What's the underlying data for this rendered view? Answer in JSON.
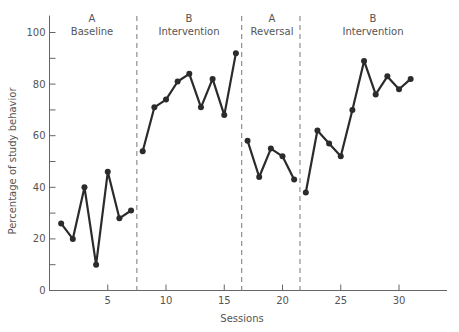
{
  "chart_data": {
    "type": "line",
    "title": "",
    "xlabel": "Sessions",
    "ylabel": "Percentage of study behavior",
    "xlim": [
      0,
      34
    ],
    "ylim": [
      0,
      105
    ],
    "x_ticks": [
      5,
      10,
      15,
      20,
      25,
      30
    ],
    "y_ticks_labeled": [
      0,
      20,
      40,
      60,
      80,
      100
    ],
    "y_ticks_minor": [
      10,
      30,
      50,
      70,
      90
    ],
    "grid": false,
    "legend": null,
    "phase_lines": [
      7.5,
      16.5,
      21.5
    ],
    "phases": [
      {
        "letter": "A",
        "name": "Baseline",
        "sessions": [
          1,
          2,
          3,
          4,
          5,
          6,
          7
        ],
        "values": [
          26,
          20,
          40,
          10,
          46,
          28,
          31
        ]
      },
      {
        "letter": "B",
        "name": "Intervention",
        "sessions": [
          8,
          9,
          10,
          11,
          12,
          13,
          14,
          15,
          16
        ],
        "values": [
          54,
          71,
          74,
          81,
          84,
          71,
          82,
          68,
          92
        ]
      },
      {
        "letter": "A",
        "name": "Reversal",
        "sessions": [
          17,
          18,
          19,
          20,
          21
        ],
        "values": [
          58,
          44,
          55,
          52,
          43
        ]
      },
      {
        "letter": "B",
        "name": "Intervention",
        "sessions": [
          22,
          23,
          24,
          25,
          26,
          27,
          28,
          29,
          30,
          31
        ],
        "values": [
          38,
          62,
          57,
          52,
          70,
          89,
          76,
          83,
          78,
          82
        ]
      }
    ]
  },
  "colors": {
    "line": "#2b2b2b",
    "axis": "#666666",
    "text": "#555555",
    "dashed": "#777777"
  }
}
